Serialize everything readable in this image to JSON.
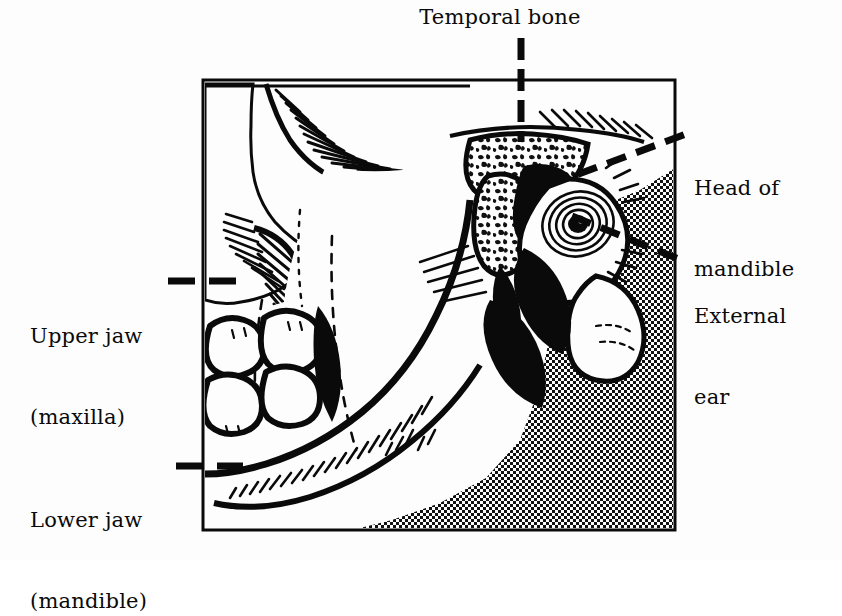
{
  "figure": {
    "kind": "anatomical-line-drawing",
    "background_color": "#fdfdfd",
    "ink_color": "#0a0a0a",
    "frame": {
      "x": 203,
      "y": 80,
      "width": 472,
      "height": 450,
      "border_color": "#0a0a0a",
      "border_width": 3
    }
  },
  "labels": [
    {
      "id": "temporal-bone",
      "lines": [
        "Temporal bone"
      ],
      "text": "Temporal bone",
      "position": "top-center",
      "x": 390,
      "y": 8,
      "leader": "vertical-dashed-down"
    },
    {
      "id": "head-of-mandible",
      "lines": [
        "Head of",
        "mandible"
      ],
      "text": "Head of mandible",
      "position": "right-upper",
      "x": 694,
      "y": 124,
      "leader": "diagonal-dashed-left-down"
    },
    {
      "id": "external-ear",
      "lines": [
        "External",
        "ear"
      ],
      "text": "External ear",
      "position": "right-lower",
      "x": 694,
      "y": 252,
      "leader": "diagonal-dashed-left-up"
    },
    {
      "id": "upper-jaw-maxilla",
      "lines": [
        "Upper jaw",
        "(maxilla)"
      ],
      "text": "Upper jaw (maxilla)",
      "position": "left-upper",
      "x": 30,
      "y": 263,
      "leader": "horizontal-dashed-right"
    },
    {
      "id": "lower-jaw-mandible",
      "lines": [
        "Lower jaw",
        "(mandible)"
      ],
      "text": "Lower jaw (mandible)",
      "position": "left-lower",
      "x": 30,
      "y": 447,
      "leader": "horizontal-dashed-right"
    }
  ],
  "structures": [
    {
      "id": "temporal-bone-body",
      "name": "Temporal bone",
      "fill": "cancellous-speckle"
    },
    {
      "id": "mandibular-condyle",
      "name": "Head of mandible",
      "fill": "cancellous-speckle"
    },
    {
      "id": "external-auditory-meatus",
      "name": "External ear canal",
      "fill": "concentric-spiral"
    },
    {
      "id": "maxilla",
      "name": "Upper jaw (maxilla)",
      "fill": "white"
    },
    {
      "id": "mandible-ramus-body",
      "name": "Lower jaw (mandible)",
      "fill": "white"
    },
    {
      "id": "molar-teeth",
      "name": "Upper and lower molars",
      "count": 4,
      "fill": "white"
    },
    {
      "id": "temporalis-muscle",
      "name": "Temporalis muscle insertion",
      "fill": "stipple"
    },
    {
      "id": "soft-tissue-neck",
      "name": "Soft tissue / neck",
      "fill": "stipple"
    },
    {
      "id": "masseter-shadow",
      "name": "Masseter / deep shadow",
      "fill": "solid-black"
    }
  ]
}
